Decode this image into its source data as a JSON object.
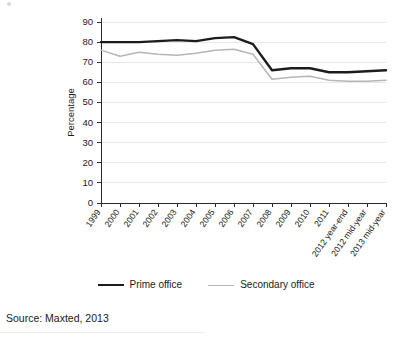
{
  "figure": {
    "source_caption": "Source: Maxted, 2013",
    "corner_mark_name": "scan-artifact-dot"
  },
  "legend": {
    "position": "bottom-center",
    "entries": [
      {
        "label": "Prime office",
        "color": "#1c1c1c",
        "width": 2.4
      },
      {
        "label": "Secondary office",
        "color": "#b6b6b6",
        "width": 1.5
      }
    ]
  },
  "chart_data": {
    "type": "line",
    "title": "",
    "subtitle": "",
    "xlabel": "",
    "ylabel": "Percentage",
    "ylim": [
      0,
      90
    ],
    "ytick_step": 10,
    "yticks": [
      0,
      10,
      20,
      30,
      40,
      50,
      60,
      70,
      80,
      90
    ],
    "grid": true,
    "grid_axis": "y",
    "legend_position": "bottom-center",
    "categories": [
      "1999",
      "2000",
      "2001",
      "2002",
      "2003",
      "2004",
      "2005",
      "2006",
      "2007",
      "2008",
      "2009",
      "2010",
      "2011",
      "2012 year-end",
      "2012 mid-year",
      "2013 mid-year"
    ],
    "series": [
      {
        "name": "Prime office",
        "color": "#1c1c1c",
        "width": 2.4,
        "values": [
          80,
          80,
          80,
          80.5,
          81,
          80.5,
          82,
          82.5,
          79,
          66,
          67,
          67,
          65,
          65,
          65.5,
          66
        ]
      },
      {
        "name": "Secondary office",
        "color": "#b6b6b6",
        "width": 1.5,
        "values": [
          76,
          73,
          75,
          74,
          73.5,
          74.5,
          76,
          76.5,
          74,
          61.5,
          62.5,
          63,
          61,
          60.5,
          60.5,
          61
        ]
      }
    ]
  }
}
